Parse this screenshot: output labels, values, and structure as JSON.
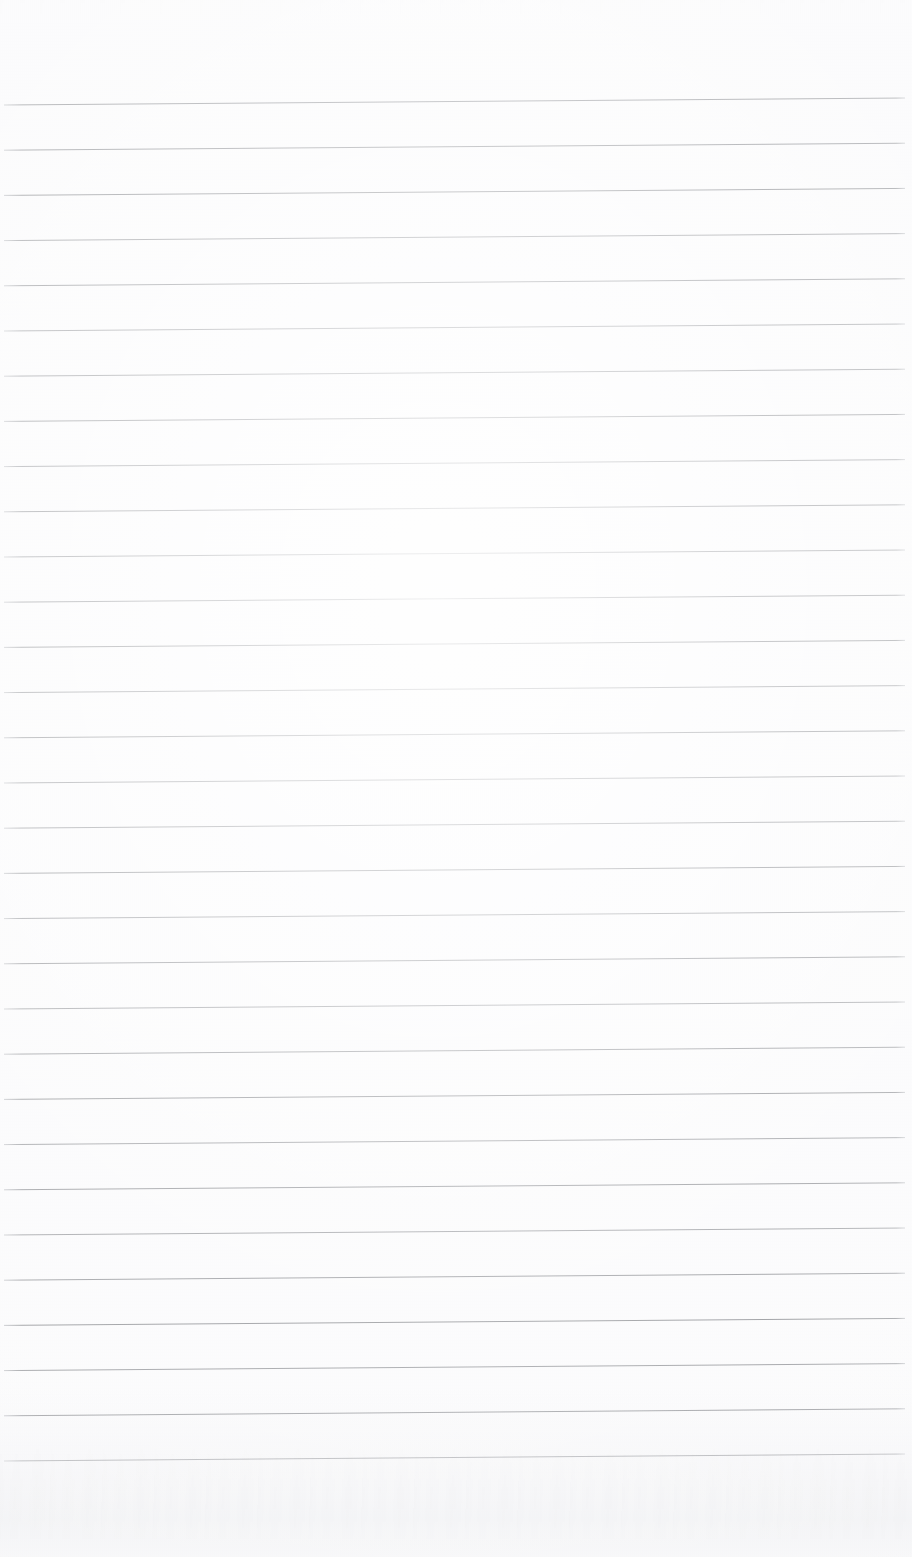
{
  "document": {
    "kind": "scanned-lined-paper",
    "title": "Blank ruled notebook page",
    "page_width": 912,
    "page_height": 1557,
    "background_color": "#fbfbfc",
    "visible_text": "",
    "notes": "No text, headings, marks or handwriting are present on the page."
  },
  "ruling": {
    "line_color": "#8e9094",
    "line_color_light": "#b9bbbf",
    "line_thickness": 1,
    "line_count": 31,
    "first_line_y_left": 105,
    "line_spacing": 45.2,
    "left_x": 4,
    "right_x": 905,
    "right_rise": 7,
    "top_margin": 105,
    "bottom_margin": 95,
    "left_margin": 4,
    "right_margin": 7
  },
  "scan_artifacts": {
    "vignette": "radial-light-center",
    "grain": "fine-paper-noise",
    "bleed_through_bottom": true,
    "bleed_through_top": true,
    "skew_degrees": -0.45
  }
}
